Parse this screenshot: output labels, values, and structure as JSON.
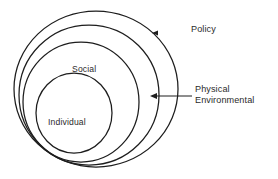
{
  "diagram": {
    "type": "nested-circles-venn",
    "background_color": "#ffffff",
    "stroke_color": "#1d1d1d",
    "text_color": "#2b2b2b",
    "rings": [
      {
        "id": "policy",
        "label": "Policy",
        "label_placement": "external-right",
        "order": 1,
        "level": "outermost"
      },
      {
        "id": "physical-environmental",
        "label": "Physical Environmental",
        "label_line_1": "Physical",
        "label_line_2": "Environmental",
        "label_placement": "external-right",
        "order": 2,
        "level": "second"
      },
      {
        "id": "social",
        "label": "Social",
        "label_placement": "internal-top",
        "order": 3,
        "level": "third"
      },
      {
        "id": "individual",
        "label": "Individual",
        "label_placement": "internal-center",
        "order": 4,
        "level": "innermost"
      }
    ],
    "callouts": [
      {
        "id": "policy-callout",
        "text": "Policy",
        "arrow": "left-pointing",
        "target_ring": "policy"
      },
      {
        "id": "physical-environmental-callout",
        "text": "Physical Environmental",
        "arrow": "left-pointing",
        "target_ring": "physical-environmental"
      }
    ]
  }
}
